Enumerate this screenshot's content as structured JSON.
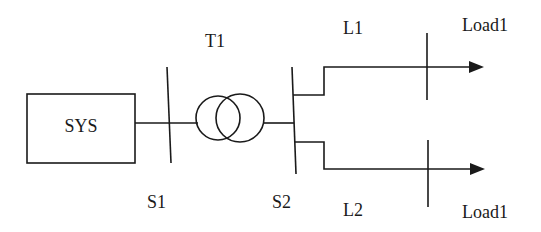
{
  "diagram": {
    "title": "",
    "colors": {
      "stroke": "#1a1a1a",
      "background": "#ffffff"
    },
    "source": {
      "label": "SYS"
    },
    "buses": [
      {
        "label": "S1"
      },
      {
        "label": "S2"
      }
    ],
    "transformer": {
      "label": "T1"
    },
    "lines": [
      {
        "label": "L1"
      },
      {
        "label": "L2"
      }
    ],
    "loads": [
      {
        "label": "Load1"
      },
      {
        "label": "Load1"
      }
    ]
  }
}
